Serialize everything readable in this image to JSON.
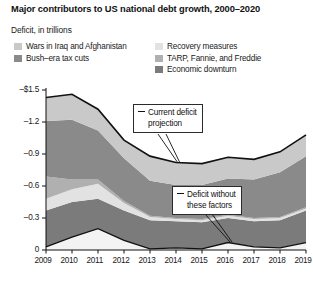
{
  "title": "Major contributors to US national debt growth, 2000–2020",
  "subtitle": "Deficit, in trillions",
  "legend": {
    "left": [
      {
        "label": "Wars in Iraq and Afghanistan",
        "color": "#c9c9c9",
        "name": "wars"
      },
      {
        "label": "Bush–era tax cuts",
        "color": "#8a8a8a",
        "name": "tax-cuts"
      }
    ],
    "right": [
      {
        "label": "Recovery measures",
        "color": "#e2e2e2",
        "name": "recovery"
      },
      {
        "label": "TARP, Fannie, and Freddie",
        "color": "#b0b0b0",
        "name": "tarp"
      },
      {
        "label": "Economic downturn",
        "color": "#7b7b7b",
        "name": "downturn"
      }
    ]
  },
  "annotations": {
    "current": {
      "line1": "Current deficit",
      "line2": "projection"
    },
    "without": {
      "line1": "Deficit without",
      "line2": "these factors"
    }
  },
  "chart_data": {
    "type": "area",
    "title": "Major contributors to US national debt growth, 2000–2020",
    "xlabel": "",
    "ylabel": "Deficit, in trillions",
    "grid": false,
    "legend_position": "top",
    "stacked": true,
    "x": [
      2009,
      2010,
      2011,
      2012,
      2013,
      2014,
      2015,
      2016,
      2017,
      2018,
      2019
    ],
    "categories": [
      "2009",
      "2010",
      "2011",
      "2012",
      "2013",
      "2014",
      "2015",
      "2016",
      "2017",
      "2018",
      "2019"
    ],
    "ylim": [
      0,
      -1.5
    ],
    "yticks": [
      0,
      -0.3,
      -0.6,
      -0.9,
      -1.2,
      -1.5
    ],
    "ytick_labels": [
      "0",
      "–0.3",
      "–0.6",
      "–0.9",
      "–1.2",
      "–$1.5"
    ],
    "series": [
      {
        "name": "Deficit without these factors",
        "color": "#f3f3f3",
        "values": [
          0.03,
          0.12,
          0.2,
          0.09,
          0.01,
          0.02,
          0.01,
          0.07,
          0.03,
          0.02,
          0.07
        ]
      },
      {
        "name": "Economic downturn",
        "color": "#7b7b7b",
        "values": [
          0.34,
          0.33,
          0.28,
          0.28,
          0.27,
          0.25,
          0.25,
          0.23,
          0.24,
          0.26,
          0.3
        ]
      },
      {
        "name": "Recovery measures",
        "color": "#e2e2e2",
        "values": [
          0.11,
          0.12,
          0.14,
          0.07,
          0.03,
          0.02,
          0.02,
          0.02,
          0.02,
          0.02,
          0.02
        ]
      },
      {
        "name": "TARP, Fannie, and Freddie",
        "color": "#b0b0b0",
        "values": [
          0.21,
          0.09,
          0.04,
          0.02,
          0.01,
          0.01,
          0.01,
          0.01,
          0.01,
          0.01,
          0.01
        ]
      },
      {
        "name": "Bush–era tax cuts",
        "color": "#8a8a8a",
        "values": [
          0.52,
          0.56,
          0.46,
          0.4,
          0.33,
          0.31,
          0.32,
          0.34,
          0.36,
          0.42,
          0.48
        ]
      },
      {
        "name": "Wars in Iraq and Afghanistan",
        "color": "#c9c9c9",
        "values": [
          0.22,
          0.24,
          0.2,
          0.17,
          0.23,
          0.21,
          0.2,
          0.2,
          0.19,
          0.19,
          0.2
        ]
      }
    ],
    "totals": [
      1.43,
      1.46,
      1.32,
      1.03,
      0.88,
      0.82,
      0.81,
      0.87,
      0.85,
      0.92,
      1.08
    ],
    "annotations": [
      {
        "text": "Current deficit projection",
        "points_to": "top boundary near 2015"
      },
      {
        "text": "Deficit without these factors",
        "points_to": "bottom band near 2017"
      }
    ]
  }
}
